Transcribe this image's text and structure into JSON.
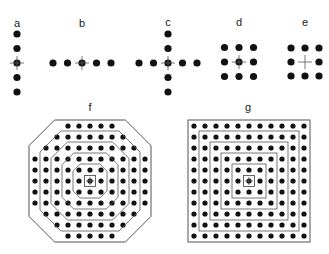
{
  "figure": {
    "colors": {
      "dot": "#111111",
      "line": "#555555",
      "background": "#ffffff"
    },
    "panels": [
      {
        "id": "a",
        "label": "a",
        "label_pos": [
          17,
          23
        ],
        "layout": "vertical-line",
        "count": 5,
        "center": [
          17,
          63
        ],
        "spacing": 14.5,
        "center_marker": "cross-through-dot"
      },
      {
        "id": "b",
        "label": "b",
        "label_pos": [
          82,
          23
        ],
        "layout": "horizontal-line",
        "count": 5,
        "center": [
          82,
          63
        ],
        "spacing": 14.5,
        "center_marker": "cross-through-dot"
      },
      {
        "id": "c",
        "label": "c",
        "label_pos": [
          168,
          22
        ],
        "layout": "cross",
        "arm_length": 2,
        "center": [
          168,
          63
        ],
        "spacing": 14.5,
        "center_marker": "cross-through-dot"
      },
      {
        "id": "d",
        "label": "d",
        "label_pos": [
          239,
          22
        ],
        "layout": "grid-3x3",
        "center": [
          239,
          62
        ],
        "spacing": 14.5,
        "center_marker": "cross-through-dot"
      },
      {
        "id": "e",
        "label": "e",
        "label_pos": [
          305,
          22
        ],
        "layout": "grid-3x3-empty-center",
        "center": [
          305,
          62
        ],
        "spacing": 14,
        "center_marker": "cross-only"
      },
      {
        "id": "f",
        "label": "f",
        "label_pos": [
          90,
          107
        ],
        "layout": "octagon",
        "center": [
          90,
          181
        ],
        "spacing": 11,
        "row_counts": [
          5,
          7,
          9,
          11,
          11,
          11,
          11,
          11,
          9,
          7,
          5
        ],
        "rings": 5,
        "center_marker": "small-square"
      },
      {
        "id": "g",
        "label": "g",
        "label_pos": [
          248,
          107
        ],
        "layout": "square",
        "center": [
          249,
          181
        ],
        "spacing": 11,
        "grid": 11,
        "rings": 5,
        "center_marker": "small-square"
      }
    ]
  }
}
